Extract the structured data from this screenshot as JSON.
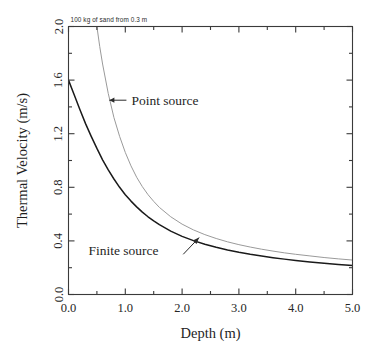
{
  "figure": {
    "background_color": "#ffffff",
    "note": "100 kg of sand from 0.3 m"
  },
  "chart_data": {
    "type": "line",
    "title": "",
    "subtitle": "",
    "annotation_note": "100 kg of sand from 0.3 m",
    "xlabel": "Depth (m)",
    "ylabel": "Thermal Velocity (m/s)",
    "xlim": [
      0.0,
      5.0
    ],
    "ylim": [
      0.0,
      2.0
    ],
    "xticks": [
      0.0,
      1.0,
      2.0,
      3.0,
      4.0,
      5.0
    ],
    "xtick_labels": [
      "0.0",
      "1.0",
      "2.0",
      "3.0",
      "4.0",
      "5.0"
    ],
    "yticks": [
      0.0,
      0.4,
      0.8,
      1.2,
      1.6,
      2.0
    ],
    "ytick_labels": [
      "0.0",
      "0.4",
      "0.8",
      "1.2",
      "1.6",
      "2.0"
    ],
    "x_minor_tick_interval": 0.5,
    "y_minor_tick_interval": 0.2,
    "grid": false,
    "legend": "inline-annotations",
    "legend_position": "inline",
    "frame": "box-all-four-sides",
    "tick_direction": "in",
    "series": [
      {
        "name": "Point source",
        "color": "#9a9a9a",
        "line_width": 1.0,
        "label_text": "Point source",
        "arrow": "left",
        "x": [
          0.45,
          0.5,
          0.55,
          0.6,
          0.7,
          0.8,
          0.9,
          1.0,
          1.1,
          1.2,
          1.3,
          1.4,
          1.5,
          1.6,
          1.8,
          2.0,
          2.2,
          2.4,
          2.6,
          2.8,
          3.0,
          3.2,
          3.4,
          3.6,
          3.8,
          4.0,
          4.25,
          4.5,
          4.75,
          5.0
        ],
        "y": [
          2.2,
          2.0,
          1.85,
          1.72,
          1.5,
          1.32,
          1.18,
          1.06,
          0.96,
          0.875,
          0.805,
          0.745,
          0.695,
          0.65,
          0.58,
          0.525,
          0.482,
          0.447,
          0.418,
          0.393,
          0.372,
          0.354,
          0.338,
          0.324,
          0.311,
          0.3,
          0.288,
          0.276,
          0.266,
          0.257
        ]
      },
      {
        "name": "Finite source",
        "color": "#1a1a1a",
        "line_width": 1.5,
        "label_text": "Finite source",
        "arrow": "up-right",
        "x": [
          0.0,
          0.1,
          0.2,
          0.3,
          0.4,
          0.5,
          0.6,
          0.7,
          0.8,
          0.9,
          1.0,
          1.1,
          1.2,
          1.3,
          1.4,
          1.5,
          1.6,
          1.8,
          2.0,
          2.2,
          2.4,
          2.6,
          2.8,
          3.0,
          3.2,
          3.4,
          3.6,
          3.8,
          4.0,
          4.25,
          4.5,
          4.75,
          5.0
        ],
        "y": [
          1.6,
          1.49,
          1.38,
          1.275,
          1.18,
          1.09,
          1.005,
          0.93,
          0.862,
          0.8,
          0.745,
          0.697,
          0.654,
          0.615,
          0.58,
          0.549,
          0.521,
          0.473,
          0.434,
          0.402,
          0.375,
          0.352,
          0.332,
          0.315,
          0.3,
          0.287,
          0.275,
          0.264,
          0.254,
          0.243,
          0.233,
          0.224,
          0.216
        ]
      }
    ]
  },
  "axes": {
    "x_axis_label": "Depth (m)",
    "y_axis_label": "Thermal Velocity (m/s)"
  }
}
